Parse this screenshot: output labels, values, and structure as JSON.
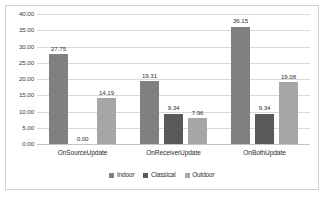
{
  "chart_data": {
    "type": "bar",
    "title": "",
    "subtitle": "",
    "xlabel": "",
    "ylabel": "",
    "categories": [
      "OnSourceUpdate",
      "OnReceiverUpdate",
      "OnBothUpdate"
    ],
    "series": [
      {
        "name": "Indoor",
        "color": "#808080",
        "values": [
          27.75,
          19.31,
          36.15
        ],
        "labels": [
          "27.75",
          "19.31",
          "36.15"
        ]
      },
      {
        "name": "Classical",
        "color": "#595959",
        "values": [
          0.0,
          9.34,
          9.34
        ],
        "labels": [
          "0.00",
          "9.34",
          "9.34"
        ]
      },
      {
        "name": "Outdoor",
        "color": "#a6a6a6",
        "values": [
          14.19,
          7.96,
          19.08
        ],
        "labels": [
          "14.19",
          "7.96",
          "19.08"
        ]
      }
    ],
    "ylim": [
      0,
      40
    ],
    "ytick_step": 5,
    "ytick_labels": [
      "0.00",
      "5.00",
      "10.00",
      "15.00",
      "20.00",
      "25.00",
      "30.00",
      "35.00",
      "40.00"
    ],
    "grid": "horizontal",
    "legend_position": "bottom-center",
    "data_labels": true,
    "border_color": "#d0d0d0",
    "gridline_color": "#d9d9d9",
    "background": "#ffffff"
  }
}
